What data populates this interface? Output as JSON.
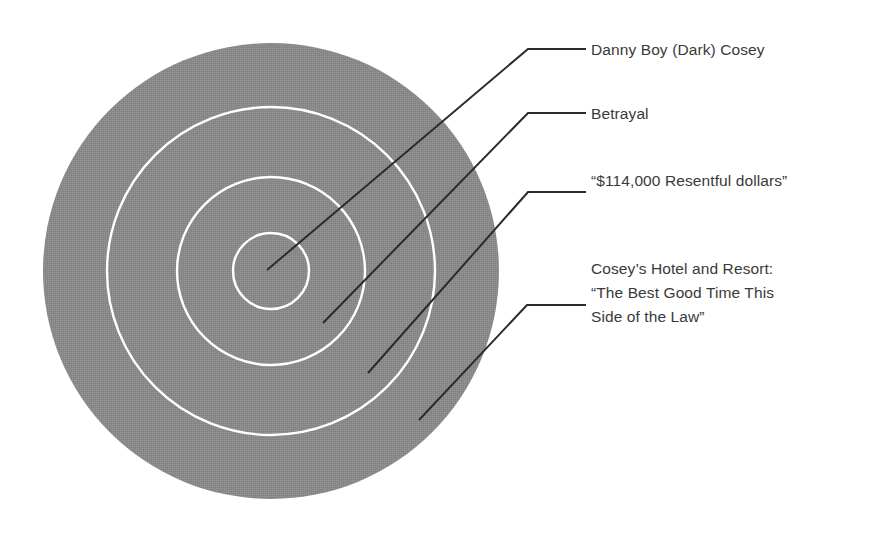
{
  "figure": {
    "type": "concentric-circle-diagram",
    "background_color": "#ffffff",
    "disc_color": "#8a8a8a",
    "ring_color": "#ffffff",
    "leader_color": "#2b2b2b",
    "text_color": "#3a3a3a",
    "center": {
      "x": 271,
      "y": 271
    },
    "disc_radius": 228,
    "ring_radii": [
      164,
      94,
      38
    ]
  },
  "labels": [
    {
      "id": "label-innermost",
      "text": "Danny Boy (Dark) Cosey",
      "target_ring": "center",
      "leader": {
        "x1": 267,
        "y1": 270,
        "x2": 528,
        "y2": 49,
        "x3": 586,
        "y3": 49
      }
    },
    {
      "id": "label-ring-1",
      "text": "Betrayal",
      "target_ring": "inner-ring",
      "leader": {
        "x1": 323,
        "y1": 323,
        "x2": 528,
        "y2": 113,
        "x3": 586,
        "y3": 113
      }
    },
    {
      "id": "label-ring-2",
      "text": "“$114,000 Resentful dollars”",
      "target_ring": "middle-ring",
      "leader": {
        "x1": 368,
        "y1": 373,
        "x2": 528,
        "y2": 192,
        "x3": 586,
        "y3": 192
      }
    },
    {
      "id": "label-ring-3",
      "text": "Cosey’s Hotel and Resort: “The Best Good Time This Side of the Law”",
      "target_ring": "outer-disc",
      "leader": {
        "x1": 419,
        "y1": 420,
        "x2": 527,
        "y2": 305,
        "x3": 586,
        "y3": 305
      }
    }
  ]
}
